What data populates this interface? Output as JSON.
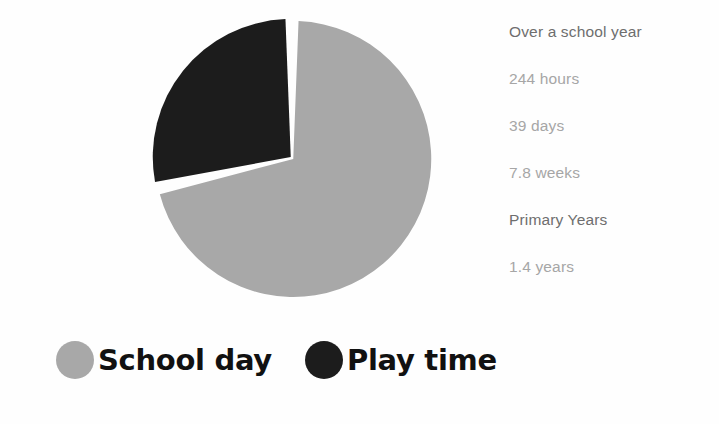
{
  "chart_data": {
    "type": "pie",
    "title": "",
    "categories": [
      "School day",
      "Play time"
    ],
    "values": [
      71.5,
      28.5
    ],
    "colors": [
      "#a8a8a8",
      "#1c1c1c"
    ],
    "start_angle_deg": 0,
    "direction": "counterclockwise",
    "slice_gap": true,
    "legend_position": "bottom",
    "grid": false,
    "annotations": [
      "Over a school year",
      "244 hours",
      "39 days",
      "7.8 weeks",
      "Primary Years",
      "1.4 years"
    ]
  },
  "pie": {
    "slices": [
      {
        "name": "School day",
        "label": "School day",
        "percent": 71.5,
        "color": "#a8a8a8"
      },
      {
        "name": "Play time",
        "label": "Play time",
        "percent": 28.5,
        "color": "#1c1c1c"
      }
    ],
    "background": "#ffffff",
    "separator_color": "#ffffff"
  },
  "stats": {
    "lines": [
      {
        "text": "Over a school year",
        "style": "heading"
      },
      {
        "text": "244 hours",
        "style": "value"
      },
      {
        "text": "39 days",
        "style": "value"
      },
      {
        "text": "7.8 weeks",
        "style": "value"
      },
      {
        "text": "Primary Years",
        "style": "heading"
      },
      {
        "text": "1.4 years",
        "style": "value"
      }
    ],
    "heading_color": "#6e6e6e",
    "value_color": "#a6a6a6"
  },
  "legend": {
    "items": [
      {
        "label": "School day",
        "color": "#a8a8a8",
        "swatch": "circle-swatch-gray"
      },
      {
        "label": "Play time",
        "color": "#1c1c1c",
        "swatch": "circle-swatch-black"
      }
    ]
  }
}
